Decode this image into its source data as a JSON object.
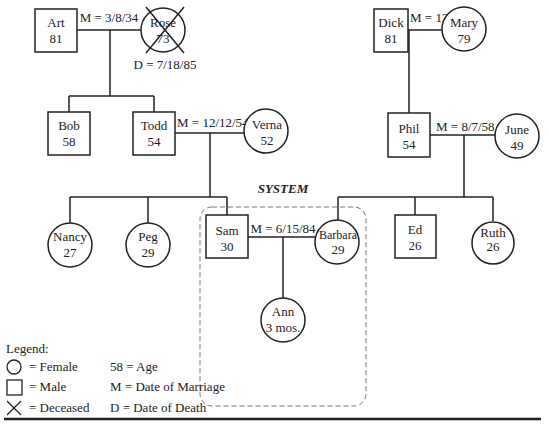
{
  "title": "SYSTEM",
  "people": {
    "art": {
      "name": "Art",
      "age": "81",
      "sex": "male"
    },
    "rose": {
      "name": "Rose",
      "age": "73",
      "sex": "female",
      "deceased": true
    },
    "dick": {
      "name": "Dick",
      "age": "81",
      "sex": "male"
    },
    "mary": {
      "name": "Mary",
      "age": "79",
      "sex": "female"
    },
    "bob": {
      "name": "Bob",
      "age": "58",
      "sex": "male"
    },
    "todd": {
      "name": "Todd",
      "age": "54",
      "sex": "male"
    },
    "verna": {
      "name": "Verna",
      "age": "52",
      "sex": "female"
    },
    "phil": {
      "name": "Phil",
      "age": "54",
      "sex": "male"
    },
    "june": {
      "name": "June",
      "age": "49",
      "sex": "female"
    },
    "nancy": {
      "name": "Nancy",
      "age": "27",
      "sex": "female"
    },
    "peg": {
      "name": "Peg",
      "age": "29",
      "sex": "female"
    },
    "sam": {
      "name": "Sam",
      "age": "30",
      "sex": "male"
    },
    "barbara": {
      "name": "Barbara",
      "age": "29",
      "sex": "female"
    },
    "ed": {
      "name": "Ed",
      "age": "26",
      "sex": "male"
    },
    "ruth": {
      "name": "Ruth",
      "age": "26",
      "sex": "female"
    },
    "ann": {
      "name": "Ann",
      "age": "3 mos.",
      "sex": "female"
    }
  },
  "marriages": {
    "art_rose": "M = 3/8/34",
    "dick_mary": "M = 12/15/36",
    "todd_verna": "M = 12/12/54",
    "phil_june": "M = 8/7/58",
    "sam_barbara": "M = 6/15/84"
  },
  "deaths": {
    "rose": "D = 7/18/85"
  },
  "legend": {
    "title": "Legend:",
    "female": "= Female",
    "male": "= Male",
    "deceased": "= Deceased",
    "age": "58 = Age",
    "marriage": "M = Date of Marriage",
    "death": "D = Date of Death"
  }
}
